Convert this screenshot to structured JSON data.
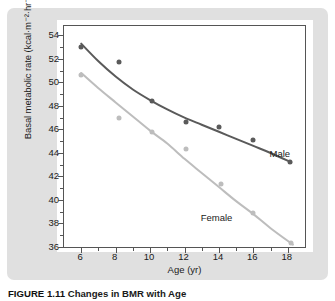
{
  "figure": {
    "caption_number": "FIGURE 1.11",
    "caption_title": "Changes in BMR with Age"
  },
  "colors": {
    "male_series": "#5a5a5a",
    "female_series": "#bdbdbd",
    "panel_background": "#e0e0e0",
    "plot_background": "#ffffff",
    "axis": "#555555",
    "text": "#1a1a1a"
  },
  "chart_data": {
    "type": "scatter",
    "title": "",
    "xlabel": "Age (yr)",
    "ylabel": "Basal metabolic rate (kcal·m⁻²·hr⁻¹)",
    "xlim": [
      5,
      19
    ],
    "ylim": [
      36,
      54.8
    ],
    "xticks": [
      6,
      8,
      10,
      12,
      14,
      16,
      18
    ],
    "xtick_labels": [
      "6",
      "8",
      "10",
      "12",
      "14",
      "16",
      "18"
    ],
    "xminor_ticks": [
      5,
      7,
      9,
      11,
      13,
      15,
      17,
      19
    ],
    "yticks": [
      36,
      38,
      40,
      42,
      44,
      46,
      48,
      50,
      52,
      54
    ],
    "ytick_labels": [
      "36",
      "38",
      "40",
      "42",
      "44",
      "46",
      "48",
      "50",
      "52",
      "54"
    ],
    "yminor_ticks": [
      37,
      39,
      41,
      43,
      45,
      47,
      49,
      51,
      53
    ],
    "grid": false,
    "legend_position": "in-plot annotations",
    "series": [
      {
        "name": "Male",
        "color": "#5a5a5a",
        "marker": "filled-circle",
        "points": [
          {
            "x": 6.0,
            "y": 53.0
          },
          {
            "x": 8.2,
            "y": 51.7
          },
          {
            "x": 10.1,
            "y": 48.4
          },
          {
            "x": 12.1,
            "y": 46.6
          },
          {
            "x": 14.0,
            "y": 46.2
          },
          {
            "x": 16.0,
            "y": 45.1
          },
          {
            "x": 18.1,
            "y": 43.2
          }
        ],
        "fit_curve": [
          {
            "x": 6.0,
            "y": 53.3
          },
          {
            "x": 7.0,
            "y": 51.8
          },
          {
            "x": 8.0,
            "y": 50.5
          },
          {
            "x": 9.0,
            "y": 49.4
          },
          {
            "x": 10.0,
            "y": 48.5
          },
          {
            "x": 11.0,
            "y": 47.7
          },
          {
            "x": 12.0,
            "y": 47.0
          },
          {
            "x": 13.0,
            "y": 46.4
          },
          {
            "x": 14.0,
            "y": 45.8
          },
          {
            "x": 15.0,
            "y": 45.2
          },
          {
            "x": 16.0,
            "y": 44.6
          },
          {
            "x": 17.0,
            "y": 44.0
          },
          {
            "x": 18.2,
            "y": 43.2
          }
        ]
      },
      {
        "name": "Female",
        "color": "#bdbdbd",
        "marker": "filled-circle",
        "points": [
          {
            "x": 6.0,
            "y": 50.6
          },
          {
            "x": 8.2,
            "y": 47.0
          },
          {
            "x": 10.1,
            "y": 45.8
          },
          {
            "x": 12.1,
            "y": 44.3
          },
          {
            "x": 14.1,
            "y": 41.4
          },
          {
            "x": 16.0,
            "y": 38.9
          },
          {
            "x": 18.2,
            "y": 36.3
          }
        ],
        "fit_curve": [
          {
            "x": 6.0,
            "y": 50.8
          },
          {
            "x": 7.0,
            "y": 49.5
          },
          {
            "x": 8.0,
            "y": 48.3
          },
          {
            "x": 9.0,
            "y": 47.1
          },
          {
            "x": 10.0,
            "y": 45.9
          },
          {
            "x": 11.0,
            "y": 44.8
          },
          {
            "x": 12.0,
            "y": 43.5
          },
          {
            "x": 13.0,
            "y": 42.3
          },
          {
            "x": 14.0,
            "y": 41.1
          },
          {
            "x": 15.0,
            "y": 39.9
          },
          {
            "x": 16.0,
            "y": 38.8
          },
          {
            "x": 17.0,
            "y": 37.6
          },
          {
            "x": 18.3,
            "y": 36.2
          }
        ]
      }
    ],
    "annotations": [
      {
        "text": "Male",
        "x": 17.0,
        "y": 44.3
      },
      {
        "text": "Female",
        "x": 13.0,
        "y": 38.9
      }
    ]
  }
}
